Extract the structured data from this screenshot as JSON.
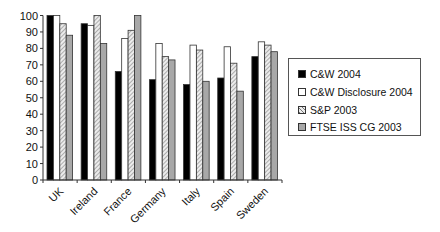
{
  "chart_data": {
    "type": "bar",
    "title": "",
    "xlabel": "",
    "ylabel": "",
    "ylim": [
      0,
      100
    ],
    "yticks": [
      0,
      10,
      20,
      30,
      40,
      50,
      60,
      70,
      80,
      90,
      100
    ],
    "grid": false,
    "legend_position": "right",
    "categories": [
      "UK",
      "Ireland",
      "France",
      "Germany",
      "Italy",
      "Spain",
      "Sweden"
    ],
    "series": [
      {
        "name": "C&W 2004",
        "fill": "#000000",
        "pattern": "solid",
        "values": [
          100,
          95,
          66,
          61,
          58,
          62,
          75
        ]
      },
      {
        "name": "C&W Disclosure 2004",
        "fill": "#ffffff",
        "pattern": "solid",
        "values": [
          100,
          94,
          86,
          83,
          82,
          81,
          84
        ]
      },
      {
        "name": "S&P 2003",
        "fill": "#d0d0d0",
        "pattern": "hatched",
        "values": [
          95,
          100,
          91,
          75,
          79,
          71,
          82
        ]
      },
      {
        "name": "FTSE ISS CG 2003",
        "fill": "#a8a8a8",
        "pattern": "solid",
        "values": [
          88,
          83,
          100,
          73,
          60,
          54,
          78
        ]
      }
    ]
  },
  "legend": {
    "items": [
      {
        "label": "C&W 2004"
      },
      {
        "label": "C&W Disclosure 2004"
      },
      {
        "label": "S&P 2003"
      },
      {
        "label": "FTSE ISS CG 2003"
      }
    ]
  }
}
